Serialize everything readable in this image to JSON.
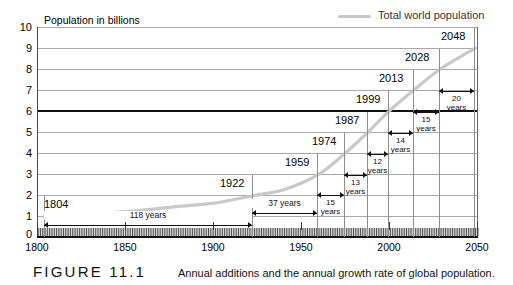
{
  "figure": {
    "number": "FIGURE 11.1",
    "caption": "Annual additions and the annual growth rate of global population."
  },
  "legend": {
    "label": "Total world population",
    "color": "#c9c9c9"
  },
  "axes": {
    "y_title": "Population in billions",
    "y_ticks": [
      "10",
      "9",
      "8",
      "7",
      "6",
      "5",
      "4",
      "3",
      "2",
      "1",
      "0"
    ],
    "x_ticks": [
      "1800",
      "1850",
      "1900",
      "1950",
      "2000",
      "2050"
    ]
  },
  "chart_data": {
    "type": "line",
    "title": "Annual additions and the annual growth rate of global population.",
    "xlabel": "",
    "ylabel": "Population in billions",
    "xlim": [
      1800,
      2050
    ],
    "ylim": [
      0,
      10
    ],
    "grid": true,
    "legend_position": "top-right",
    "series": [
      {
        "name": "Total world population",
        "color": "#c9c9c9",
        "x": [
          1804,
          1850,
          1880,
          1900,
          1922,
          1940,
          1959,
          1974,
          1987,
          1999,
          2013,
          2028,
          2048
        ],
        "y": [
          1.0,
          1.25,
          1.5,
          1.65,
          2.0,
          2.3,
          3.0,
          4.0,
          5.0,
          6.0,
          7.0,
          8.0,
          9.0
        ]
      }
    ],
    "milestones": [
      {
        "year": "1804",
        "billions": 1
      },
      {
        "year": "1922",
        "billions": 2
      },
      {
        "year": "1959",
        "billions": 3
      },
      {
        "year": "1974",
        "billions": 4
      },
      {
        "year": "1987",
        "billions": 5
      },
      {
        "year": "1999",
        "billions": 6
      },
      {
        "year": "2013",
        "billions": 7
      },
      {
        "year": "2028",
        "billions": 8
      },
      {
        "year": "2048",
        "billions": 9
      }
    ],
    "intervals": [
      {
        "from": "1804",
        "to": "1922",
        "value": "118",
        "unit": "years",
        "label": "118 years",
        "inline": true
      },
      {
        "from": "1922",
        "to": "1959",
        "value": "37",
        "unit": "years",
        "label": "37 years",
        "inline": true
      },
      {
        "from": "1959",
        "to": "1974",
        "value": "15",
        "unit": "years",
        "label": "15 years",
        "inline": false
      },
      {
        "from": "1974",
        "to": "1987",
        "value": "13",
        "unit": "years",
        "label": "13 years",
        "inline": false
      },
      {
        "from": "1987",
        "to": "1999",
        "value": "12",
        "unit": "years",
        "label": "12 years",
        "inline": false
      },
      {
        "from": "1999",
        "to": "2013",
        "value": "14",
        "unit": "years",
        "label": "14 years",
        "inline": false
      },
      {
        "from": "2013",
        "to": "2028",
        "value": "15",
        "unit": "years",
        "label": "15 years",
        "inline": false
      },
      {
        "from": "2028",
        "to": "2048",
        "value": "20",
        "unit": "years",
        "label": "20 years",
        "inline": false
      }
    ],
    "highlight_line": {
      "billions": 6,
      "color": "#111111"
    }
  }
}
